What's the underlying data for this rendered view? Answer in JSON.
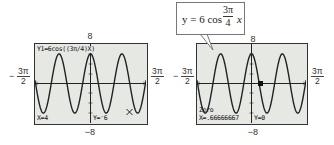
{
  "chart_data": [
    {
      "type": "line",
      "title": "Y1=6cos((3π/4)X)",
      "function": "y = 6 cos(3π/4 x)",
      "xlim_label": [
        "-3π/2",
        "3π/2"
      ],
      "ylim": [
        -8,
        8
      ],
      "x_range": [
        -4.712,
        4.712
      ],
      "amplitude": 6,
      "frequency": 2.356,
      "trace": {
        "x": "4",
        "y": "-6",
        "x_label": "X=4",
        "y_label": "Y=-6"
      },
      "grid": false
    },
    {
      "type": "line",
      "function": "y = 6 cos(3π/4 x)",
      "xlim_label": [
        "-3π/2",
        "3π/2"
      ],
      "ylim": [
        -8,
        8
      ],
      "x_range": [
        -4.712,
        4.712
      ],
      "amplitude": 6,
      "frequency": 2.356,
      "zero": {
        "label": "Zero",
        "x": ".66666667",
        "y": "0",
        "x_label": "X=.66666667",
        "y_label": "Y=0"
      },
      "annotation": "y = 6 cos (3π/4) x",
      "grid": false
    }
  ],
  "left": {
    "ymax": "8",
    "ymin": "−8",
    "xmin_num": "3π",
    "xmin_den": "2",
    "xmin_sign": "−",
    "xmax_num": "3π",
    "xmax_den": "2",
    "eq_line": "Y1=6cos((3π/4)X)",
    "x_readout": "X=4",
    "y_readout": "Y=⁻6"
  },
  "right": {
    "ymax": "8",
    "ymin": "−8",
    "xmin_num": "3π",
    "xmin_den": "2",
    "xmin_sign": "−",
    "xmax_num": "3π",
    "xmax_den": "2",
    "zero_label": "Zero",
    "x_readout": "X=.66666667",
    "y_readout": "Y=0",
    "callout": {
      "lhs": "y = 6 cos",
      "num": "3π",
      "den": "4",
      "var": "x"
    }
  },
  "colors": {
    "screen": "#e6e8e4",
    "curve": "#222222",
    "frame": "#333333"
  }
}
